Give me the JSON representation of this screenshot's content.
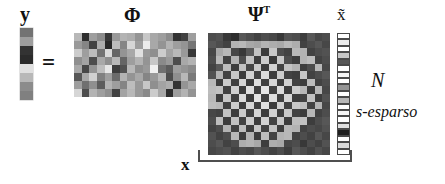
{
  "figure": {
    "type": "compressed-sensing-equation-diagram",
    "labels": {
      "y": "y",
      "equals": "=",
      "phi": "Φ",
      "psi": "Ψ",
      "psi_superscript": "T",
      "x_tilde": "x̃",
      "N": "N",
      "sparsity": "s-esparso",
      "x": "x"
    },
    "colors": {
      "background": "#ffffff",
      "ink": "#111111",
      "rule": "#4f4f4f",
      "cell_border": "#4a4a4a"
    },
    "matrices": {
      "y": {
        "name": "y",
        "rows": 8,
        "cols": 1,
        "values": [
          0.45,
          0.62,
          0.2,
          0.17,
          0.88,
          0.72,
          0.55,
          0.5
        ]
      },
      "phi": {
        "name": "Φ",
        "rows": 8,
        "cols": 16,
        "values": [
          [
            0.72,
            0.18,
            0.62,
            0.55,
            0.22,
            0.6,
            0.7,
            0.68,
            0.58,
            0.78,
            0.66,
            0.62,
            0.55,
            0.2,
            0.26,
            0.62
          ],
          [
            0.6,
            0.52,
            0.26,
            0.68,
            0.16,
            0.74,
            0.52,
            0.84,
            0.62,
            0.92,
            0.66,
            0.58,
            0.7,
            0.62,
            0.58,
            0.46
          ],
          [
            0.8,
            0.62,
            0.74,
            0.45,
            0.86,
            0.4,
            0.58,
            0.66,
            0.88,
            0.6,
            0.56,
            0.8,
            0.64,
            0.72,
            0.6,
            0.22
          ],
          [
            0.56,
            0.64,
            0.3,
            0.66,
            0.56,
            0.72,
            0.4,
            0.62,
            0.7,
            0.58,
            0.78,
            0.54,
            0.6,
            0.3,
            0.66,
            0.7
          ],
          [
            0.66,
            0.28,
            0.58,
            0.74,
            0.9,
            0.24,
            0.32,
            0.72,
            0.56,
            0.6,
            0.94,
            0.44,
            0.36,
            0.62,
            0.58,
            0.54
          ],
          [
            0.34,
            0.66,
            0.82,
            0.5,
            0.62,
            0.42,
            0.7,
            0.58,
            0.66,
            0.52,
            0.6,
            0.72,
            0.3,
            0.56,
            0.72,
            0.48
          ],
          [
            0.62,
            0.44,
            0.56,
            0.36,
            0.7,
            0.62,
            0.52,
            0.74,
            0.6,
            0.78,
            0.56,
            0.64,
            0.68,
            0.2,
            0.58,
            0.66
          ],
          [
            0.84,
            0.3,
            0.7,
            0.62,
            0.56,
            0.26,
            0.64,
            0.72,
            0.6,
            0.54,
            0.8,
            0.66,
            0.18,
            0.62,
            0.7,
            0.58
          ]
        ]
      },
      "psi": {
        "name": "Ψᵀ",
        "rows": 16,
        "cols": 16,
        "description": "radial checkerboard / DCT-like basis pattern",
        "pattern": "radial-checker",
        "values": [
          [
            0.3,
            0.32,
            0.22,
            0.18,
            0.34,
            0.3,
            0.26,
            0.3,
            0.28,
            0.22,
            0.32,
            0.3,
            0.24,
            0.34,
            0.28,
            0.3
          ],
          [
            0.34,
            0.3,
            0.26,
            0.7,
            0.72,
            0.66,
            0.64,
            0.7,
            0.68,
            0.66,
            0.72,
            0.68,
            0.26,
            0.3,
            0.34,
            0.28
          ],
          [
            0.28,
            0.66,
            0.72,
            0.28,
            0.22,
            0.34,
            0.76,
            0.24,
            0.78,
            0.3,
            0.26,
            0.72,
            0.7,
            0.26,
            0.3,
            0.32
          ],
          [
            0.3,
            0.72,
            0.26,
            0.7,
            0.3,
            0.76,
            0.24,
            0.8,
            0.22,
            0.78,
            0.3,
            0.24,
            0.7,
            0.74,
            0.26,
            0.3
          ],
          [
            0.26,
            0.34,
            0.74,
            0.24,
            0.76,
            0.28,
            0.8,
            0.24,
            0.82,
            0.26,
            0.76,
            0.7,
            0.24,
            0.3,
            0.72,
            0.28
          ],
          [
            0.32,
            0.7,
            0.26,
            0.78,
            0.24,
            0.82,
            0.26,
            0.86,
            0.24,
            0.8,
            0.26,
            0.24,
            0.78,
            0.26,
            0.3,
            0.34
          ],
          [
            0.72,
            0.24,
            0.8,
            0.26,
            0.84,
            0.24,
            0.88,
            0.26,
            0.84,
            0.24,
            0.82,
            0.26,
            0.24,
            0.74,
            0.26,
            0.3
          ],
          [
            0.74,
            0.76,
            0.26,
            0.82,
            0.24,
            0.88,
            0.26,
            0.9,
            0.26,
            0.86,
            0.24,
            0.8,
            0.72,
            0.24,
            0.72,
            0.28
          ],
          [
            0.72,
            0.24,
            0.78,
            0.26,
            0.86,
            0.24,
            0.9,
            0.26,
            0.88,
            0.26,
            0.84,
            0.24,
            0.26,
            0.76,
            0.24,
            0.32
          ],
          [
            0.74,
            0.72,
            0.26,
            0.8,
            0.24,
            0.84,
            0.26,
            0.88,
            0.24,
            0.82,
            0.26,
            0.78,
            0.74,
            0.26,
            0.7,
            0.28
          ],
          [
            0.28,
            0.26,
            0.76,
            0.24,
            0.8,
            0.26,
            0.84,
            0.24,
            0.82,
            0.24,
            0.78,
            0.26,
            0.24,
            0.72,
            0.26,
            0.3
          ],
          [
            0.3,
            0.74,
            0.24,
            0.76,
            0.26,
            0.8,
            0.24,
            0.82,
            0.26,
            0.78,
            0.24,
            0.74,
            0.76,
            0.24,
            0.3,
            0.34
          ],
          [
            0.26,
            0.3,
            0.7,
            0.26,
            0.74,
            0.24,
            0.78,
            0.26,
            0.76,
            0.24,
            0.72,
            0.7,
            0.26,
            0.3,
            0.28,
            0.32
          ],
          [
            0.32,
            0.26,
            0.3,
            0.72,
            0.24,
            0.7,
            0.24,
            0.74,
            0.26,
            0.7,
            0.72,
            0.26,
            0.3,
            0.26,
            0.34,
            0.28
          ],
          [
            0.3,
            0.34,
            0.26,
            0.3,
            0.68,
            0.7,
            0.66,
            0.24,
            0.68,
            0.66,
            0.28,
            0.3,
            0.22,
            0.3,
            0.26,
            0.32
          ],
          [
            0.28,
            0.3,
            0.32,
            0.26,
            0.3,
            0.28,
            0.34,
            0.3,
            0.26,
            0.3,
            0.24,
            0.34,
            0.3,
            0.26,
            0.32,
            0.28
          ]
        ]
      },
      "x_tilde": {
        "name": "x̃",
        "rows": 19,
        "cols": 1,
        "sparse": true,
        "values": [
          1.0,
          0.92,
          1.0,
          0.78,
          0.34,
          1.0,
          0.96,
          1.0,
          0.58,
          1.0,
          0.72,
          1.0,
          0.96,
          1.0,
          0.88,
          0.12,
          1.0,
          0.86,
          1.0
        ]
      }
    }
  }
}
